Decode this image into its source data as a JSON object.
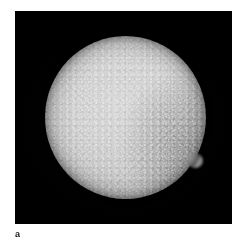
{
  "figure": {
    "panel_label": "a",
    "background_color": "#ffffff",
    "image_panel": {
      "background_color": "#000000",
      "x": 15,
      "y": 11,
      "width": 217,
      "height": 213
    },
    "subject": {
      "name": "bright-grainy-disc",
      "description": "Bright, speckled near-circular luminous body on black background",
      "center_x": 125,
      "center_y": 117,
      "radius": 80,
      "core_color": "#d2d2d2",
      "mid_color": "#c2c2c2",
      "limb_color": "#5a5a5a",
      "features": [
        {
          "name": "limb-protrusion",
          "position": "lower-right limb",
          "x": 187,
          "y": 160
        }
      ]
    }
  }
}
